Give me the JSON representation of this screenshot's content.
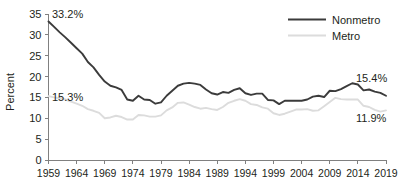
{
  "chart_data": {
    "type": "line",
    "title": "",
    "xlabel": "",
    "ylabel": "Percent",
    "ylim": [
      0,
      35
    ],
    "xlim": [
      1959,
      2019
    ],
    "ytick_labels": [
      "0",
      "5",
      "10",
      "15",
      "20",
      "25",
      "30",
      "35"
    ],
    "yticks": [
      0,
      5,
      10,
      15,
      20,
      25,
      30,
      35
    ],
    "xtick_labels": [
      "1959",
      "1964",
      "1969",
      "1974",
      "1979",
      "1984",
      "1989",
      "1994",
      "1999",
      "2004",
      "2009",
      "2014",
      "2019"
    ],
    "xticks": [
      1959,
      1964,
      1969,
      1974,
      1979,
      1984,
      1989,
      1994,
      1999,
      2004,
      2009,
      2014,
      2019
    ],
    "grid": false,
    "legend_position": "top-right",
    "x": [
      1959,
      1960,
      1961,
      1962,
      1963,
      1964,
      1965,
      1966,
      1967,
      1968,
      1969,
      1970,
      1971,
      1972,
      1973,
      1974,
      1975,
      1976,
      1977,
      1978,
      1979,
      1980,
      1981,
      1982,
      1983,
      1984,
      1985,
      1986,
      1987,
      1988,
      1989,
      1990,
      1991,
      1992,
      1993,
      1994,
      1995,
      1996,
      1997,
      1998,
      1999,
      2000,
      2001,
      2002,
      2003,
      2004,
      2005,
      2006,
      2007,
      2008,
      2009,
      2010,
      2011,
      2012,
      2013,
      2014,
      2015,
      2016,
      2017,
      2018,
      2019
    ],
    "series": [
      {
        "name": "Nonmetro",
        "color": "#3b3b3b",
        "values": [
          33.2,
          31.9,
          30.6,
          29.4,
          28.1,
          26.8,
          25.5,
          23.5,
          22.2,
          20.4,
          18.8,
          17.8,
          17.4,
          16.8,
          14.5,
          14.2,
          15.4,
          14.5,
          14.4,
          13.5,
          13.8,
          15.4,
          16.6,
          17.8,
          18.3,
          18.5,
          18.3,
          18.0,
          16.9,
          16.0,
          15.7,
          16.3,
          16.1,
          16.8,
          17.2,
          16.0,
          15.6,
          15.9,
          15.9,
          14.4,
          14.3,
          13.4,
          14.2,
          14.2,
          14.2,
          14.2,
          14.5,
          15.2,
          15.4,
          15.1,
          16.6,
          16.5,
          17.0,
          17.7,
          18.4,
          18.1,
          16.7,
          16.9,
          16.4,
          16.1,
          15.4
        ]
      },
      {
        "name": "Metro",
        "color": "#dcdcdc",
        "values": [
          15.3,
          15.0,
          14.8,
          14.5,
          14.0,
          13.5,
          13.0,
          12.2,
          11.8,
          11.3,
          10.0,
          10.2,
          10.6,
          10.3,
          9.7,
          9.7,
          10.8,
          10.7,
          10.4,
          10.4,
          10.7,
          11.9,
          12.6,
          13.7,
          13.8,
          13.3,
          12.7,
          12.3,
          12.5,
          12.2,
          12.0,
          12.7,
          13.7,
          14.2,
          14.6,
          14.2,
          13.4,
          13.2,
          12.6,
          12.3,
          11.2,
          10.8,
          11.1,
          11.6,
          12.1,
          12.1,
          12.2,
          11.8,
          11.9,
          12.9,
          13.9,
          14.9,
          14.6,
          14.5,
          14.5,
          14.5,
          13.0,
          12.7,
          12.0,
          11.6,
          11.9
        ]
      }
    ],
    "annotations": [
      {
        "text": "33.2%",
        "series": "Nonmetro",
        "x": 1959,
        "y": 33.2,
        "position": "start"
      },
      {
        "text": "15.3%",
        "series": "Metro",
        "x": 1959,
        "y": 15.3,
        "position": "start"
      },
      {
        "text": "15.4%",
        "series": "Nonmetro",
        "x": 2019,
        "y": 15.4,
        "position": "end"
      },
      {
        "text": "11.9%",
        "series": "Metro",
        "x": 2019,
        "y": 11.9,
        "position": "end"
      }
    ],
    "legend": [
      {
        "label": "Nonmetro",
        "color": "#3b3b3b"
      },
      {
        "label": "Metro",
        "color": "#dcdcdc"
      }
    ]
  }
}
